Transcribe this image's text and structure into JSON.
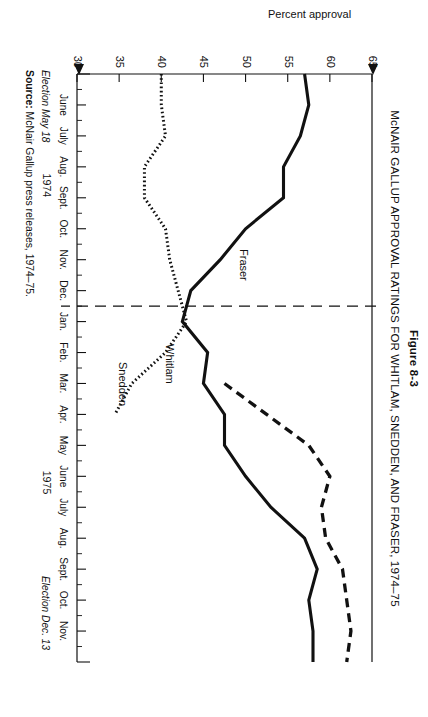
{
  "figure": {
    "number": "Figure 8-3",
    "title": "McNAIR GALLUP APPROVAL RATINGS FOR WHITLAM, SNEDDEN, AND FRASER, 1974–75",
    "source_prefix": "Source:",
    "source_text": " McNair Gallup press releases, 1974–75."
  },
  "annotations": {
    "election_start": "Election May 18",
    "election_end": "Election Dec. 13",
    "year_1974": "1974",
    "year_1975": "1975"
  },
  "chart_data": {
    "type": "line",
    "title": "McNAIR GALLUP APPROVAL RATINGS FOR WHITLAM, SNEDDEN, AND FRASER, 1974–75",
    "xlabel": "",
    "ylabel": "Percent approval",
    "ylim": [
      30,
      65
    ],
    "yticks": [
      65,
      60,
      55,
      50,
      45,
      40,
      35,
      30
    ],
    "grid": false,
    "legend": "inline-series-labels",
    "x": [
      "May 1974",
      "June 1974",
      "July 1974",
      "Aug. 1974",
      "Sept. 1974",
      "Oct. 1974",
      "Nov. 1974",
      "Dec. 1974",
      "Jan. 1975",
      "Feb. 1975",
      "Mar. 1975",
      "Apr. 1975",
      "May 1975",
      "June 1975",
      "July 1975",
      "Aug. 1975",
      "Sept. 1975",
      "Oct. 1975",
      "Nov. 1975",
      "Dec. 1975"
    ],
    "xticklabels": [
      "June",
      "July",
      "Aug.",
      "Sept.",
      "Oct.",
      "Nov.",
      "Dec.",
      "Jan.",
      "Feb.",
      "Mar.",
      "Apr.",
      "May",
      "June",
      "July",
      "Aug.",
      "Sept.",
      "Oct.",
      "Nov."
    ],
    "series": [
      {
        "name": "Whitlam",
        "style": "solid",
        "color": "#111111",
        "values": [
          57.0,
          57.5,
          56.5,
          54.5,
          54.5,
          50.0,
          47.0,
          43.5,
          42.5,
          45.5,
          45.0,
          47.5,
          47.5,
          50.0,
          53.0,
          57.0,
          58.5,
          57.5,
          58.0,
          58.0
        ]
      },
      {
        "name": "Snedden",
        "style": "dotted",
        "color": "#111111",
        "values": [
          40.0,
          40.0,
          40.5,
          38.0,
          38.0,
          40.5,
          41.0,
          42.0,
          43.0,
          40.5,
          36.5,
          34.5,
          null,
          null,
          null,
          null,
          null,
          null,
          null,
          null
        ]
      },
      {
        "name": "Fraser",
        "style": "dashed",
        "color": "#111111",
        "values": [
          null,
          null,
          null,
          null,
          null,
          null,
          null,
          null,
          null,
          null,
          47.5,
          52.5,
          57.5,
          60.0,
          59.0,
          59.5,
          61.5,
          62.0,
          62.5,
          62.0
        ]
      }
    ],
    "reference_line": {
      "orientation": "vertical",
      "at": "Dec. 1974 / Jan. 1975",
      "style": "dashed"
    },
    "markers": [
      {
        "label": "Election May 18",
        "at": "May 1974"
      },
      {
        "label": "Election Dec. 13",
        "at": "Dec. 1975"
      }
    ]
  }
}
